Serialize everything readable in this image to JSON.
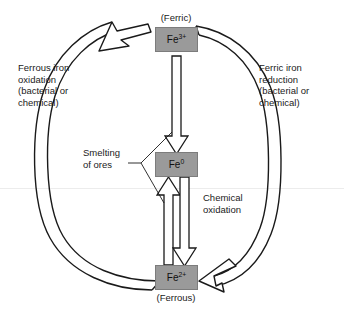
{
  "figure": {
    "background_color": "#ffffff",
    "node_fill_color": "#9a9a9a",
    "node_border_color": "#7c7c7c",
    "arrow_fill_color": "#ffffff",
    "arrow_stroke_color": "#1a1a1a",
    "separator_line_color": "#e8e8e8"
  },
  "nodes": {
    "ferric": {
      "formula": "Fe",
      "charge": "3+",
      "caption": "(Ferric)"
    },
    "metallic": {
      "formula": "Fe",
      "charge": "0",
      "caption": ""
    },
    "ferrous": {
      "formula": "Fe",
      "charge": "2+",
      "caption": "(Ferrous)"
    }
  },
  "labels": {
    "left_process": "Ferrous iron\noxidation\n(bacterial or\nchemical)",
    "right_process": "Ferric iron\nreduction\n(bacterial or\nchemical)",
    "smelting": "Smelting\nof ores",
    "chemical_oxidation": "Chemical\noxidation"
  },
  "arrows": [
    {
      "name": "ferrous-to-ferric-arc",
      "from": "Fe2+",
      "to": "Fe3+",
      "label": "Ferrous iron oxidation (bacterial or chemical)",
      "direction": "counterclockwise-left"
    },
    {
      "name": "ferric-to-ferrous-arc",
      "from": "Fe3+",
      "to": "Fe2+",
      "label": "Ferric iron reduction (bacterial or chemical)",
      "direction": "clockwise-right"
    },
    {
      "name": "ferric-to-metallic",
      "from": "Fe3+",
      "to": "Fe0",
      "label": "Smelting of ores",
      "direction": "down"
    },
    {
      "name": "ferrous-to-metallic",
      "from": "Fe2+",
      "to": "Fe0",
      "label": "Smelting of ores",
      "direction": "up"
    },
    {
      "name": "metallic-to-ferrous",
      "from": "Fe0",
      "to": "Fe2+",
      "label": "Chemical oxidation",
      "direction": "down"
    }
  ]
}
